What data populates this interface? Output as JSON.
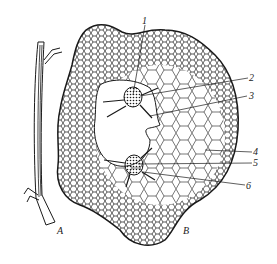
{
  "figure": {
    "panels": [
      {
        "id": "A",
        "label": "A",
        "description": "longitudinal view of stem segment"
      },
      {
        "id": "B",
        "label": "B",
        "description": "cross-section of stem with cellular tissue"
      }
    ],
    "callouts": [
      {
        "number": "1",
        "label": "1"
      },
      {
        "number": "2",
        "label": "2"
      },
      {
        "number": "3",
        "label": "3"
      },
      {
        "number": "4",
        "label": "4"
      },
      {
        "number": "5",
        "label": "5"
      },
      {
        "number": "6",
        "label": "6"
      }
    ],
    "colors": {
      "ink": "#1a1a1a",
      "background": "#ffffff"
    }
  }
}
